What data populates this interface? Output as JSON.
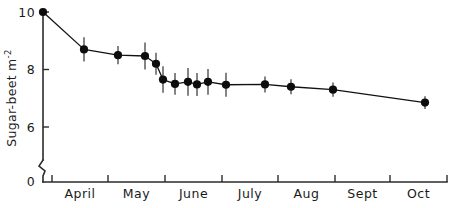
{
  "chart_data": {
    "type": "scatter",
    "title": "",
    "subtitle": "",
    "xlabel": "",
    "ylabel": "Sugar-beet m",
    "ylabel_exponent": "-2",
    "ylim": [
      0,
      10.3
    ],
    "y_ticks": [
      {
        "value": 0,
        "label": "0"
      },
      {
        "value": 6,
        "label": "6"
      },
      {
        "value": 8,
        "label": "8"
      },
      {
        "value": 10,
        "label": "10"
      }
    ],
    "y_axis_break": true,
    "grid": false,
    "legend": "none",
    "x_tick_labels": [
      "April",
      "May",
      "June",
      "July",
      "Aug",
      "Sept",
      "Oct"
    ],
    "x_tick_positions": [
      52,
      108,
      165,
      222,
      278,
      335,
      390,
      447
    ],
    "series": [
      {
        "name": "Sugar-beet plant population",
        "marker": "filled-circle",
        "line": true,
        "error_bars": "vertical",
        "points": [
          {
            "x": 43,
            "y": 10.0,
            "err": 0.12
          },
          {
            "x": 84,
            "y": 8.7,
            "err": 0.42
          },
          {
            "x": 118,
            "y": 8.5,
            "err": 0.32
          },
          {
            "x": 145,
            "y": 8.47,
            "err": 0.47
          },
          {
            "x": 156,
            "y": 8.2,
            "err": 0.38
          },
          {
            "x": 163,
            "y": 7.65,
            "err": 0.46
          },
          {
            "x": 175,
            "y": 7.5,
            "err": 0.38
          },
          {
            "x": 188,
            "y": 7.57,
            "err": 0.48
          },
          {
            "x": 197,
            "y": 7.48,
            "err": 0.4
          },
          {
            "x": 208,
            "y": 7.57,
            "err": 0.45
          },
          {
            "x": 226,
            "y": 7.47,
            "err": 0.42
          },
          {
            "x": 265,
            "y": 7.48,
            "err": 0.28
          },
          {
            "x": 291,
            "y": 7.4,
            "err": 0.26
          },
          {
            "x": 333,
            "y": 7.3,
            "err": 0.25
          },
          {
            "x": 425,
            "y": 6.85,
            "err": 0.22
          }
        ]
      }
    ]
  },
  "colors": {
    "axis": "#2b2b2b",
    "marker": "#0d0d0d",
    "line": "#121212",
    "error_bar": "#3a3a3a",
    "background": "#ffffff"
  }
}
